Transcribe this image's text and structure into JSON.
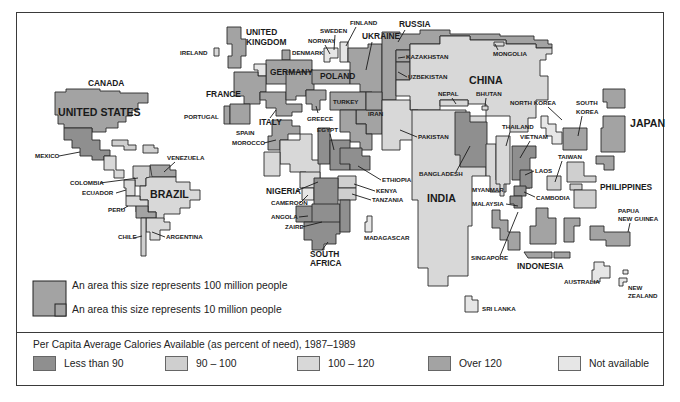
{
  "figure": {
    "legend_title": "Per Capita Average Calories Available (as percent of need), 1987–1989",
    "scale_large_label": "An area this size represents 100 million people",
    "scale_small_label": "An area this size represents 10 million people"
  },
  "categories": [
    {
      "id": "lt90",
      "label": "Less than 90",
      "color": "#8f8f8f"
    },
    {
      "id": "90to100",
      "label": "90 – 100",
      "color": "#cfcfcf"
    },
    {
      "id": "100to120",
      "label": "100 – 120",
      "color": "#d8d8d8"
    },
    {
      "id": "over120",
      "label": "Over 120",
      "color": "#a3a3a3"
    },
    {
      "id": "na",
      "label": "Not available",
      "color": "#e6e6e6"
    }
  ],
  "labels": {
    "canada": "CANADA",
    "united_states": "UNITED STATES",
    "mexico": "MEXICO",
    "venezuela": "VENEZUELA",
    "colombia": "COLOMBIA",
    "ecuador": "ECUADOR",
    "brazil": "BRAZIL",
    "peru": "PERU",
    "chile": "CHILE",
    "argentina": "ARGENTINA",
    "ireland": "IRELAND",
    "united_kingdom_1": "UNITED",
    "united_kingdom_2": "KINGDOM",
    "denmark": "DENMARK",
    "germany": "GERMANY",
    "france": "FRANCE",
    "portugal": "PORTUGAL",
    "spain": "SPAIN",
    "italy": "ITALY",
    "morocco": "MOROCCO",
    "greece": "GREECE",
    "sweden": "SWEDEN",
    "norway": "NORWAY",
    "finland": "FINLAND",
    "poland": "POLAND",
    "russia": "RUSSIA",
    "ukraine": "UKRAINE",
    "kazakhstan": "KAZAKHSTAN",
    "uzbekistan": "UZBEKISTAN",
    "turkey": "TURKEY",
    "iran": "IRAN",
    "egypt": "EGYPT",
    "nigeria": "NIGERIA",
    "cameroon": "CAMEROON",
    "ethiopia": "ETHIOPIA",
    "kenya": "KENYA",
    "tanzania": "TANZANIA",
    "angola": "ANGOLA",
    "zaire": "ZAIRE",
    "south_africa_1": "SOUTH",
    "south_africa_2": "AFRICA",
    "madagascar": "MADAGASCAR",
    "mongolia": "MONGOLIA",
    "china": "CHINA",
    "nepal": "NEPAL",
    "bhutan": "BHUTAN",
    "pakistan": "PAKISTAN",
    "india": "INDIA",
    "bangladesh": "BANGLADESH",
    "sri_lanka": "SRI LANKA",
    "north_korea": "NORTH KOREA",
    "south_korea_1": "SOUTH",
    "south_korea_2": "KOREA",
    "japan": "JAPAN",
    "thailand": "THAILAND",
    "vietnam": "VIETNAM",
    "myanmar": "MYANMAR",
    "laos": "LAOS",
    "taiwan": "TAIWAN",
    "cambodia": "CAMBODIA",
    "philippines": "PHILIPPINES",
    "malaysia": "MALAYSIA",
    "singapore": "SINGAPORE",
    "indonesia": "INDONESIA",
    "papua_1": "PAPUA",
    "papua_2": "NEW GUINEA",
    "australia": "AUSTRALIA",
    "new_zealand_1": "NEW",
    "new_zealand_2": "ZEALAND"
  }
}
